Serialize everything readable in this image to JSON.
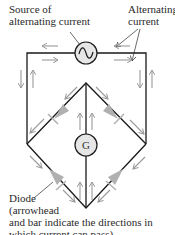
{
  "labels": {
    "source_line1": "Source of",
    "source_line2": "alternating current",
    "alt_line1": "Alternating",
    "alt_line2": "current",
    "diode_line1": "Diode",
    "diode_line2": "(arrowhead",
    "diode_line3": "and bar indicate the directions in",
    "diode_line4": "which current can pass)"
  },
  "components": {
    "ac_source_symbol": "~",
    "galvanometer_symbol": "G"
  },
  "colors": {
    "wire": "#1a1a1a",
    "arrow": "#9a9a9a",
    "diode": "#aaaaaa",
    "component_fill": "#e6e6e6"
  }
}
